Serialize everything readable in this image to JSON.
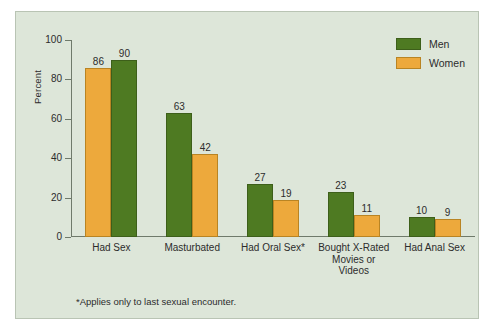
{
  "chart_data": {
    "type": "bar",
    "title": "",
    "xlabel": "",
    "ylabel": "Percent",
    "ylim": [
      0,
      100
    ],
    "yticks": [
      0,
      20,
      40,
      60,
      80,
      100
    ],
    "grid": false,
    "legend_position": "top-right",
    "categories": [
      "Had Sex",
      "Masturbated",
      "Had Oral Sex*",
      "Bought X-Rated Movies or Videos",
      "Had Anal Sex"
    ],
    "category_lines": [
      [
        "Had Sex"
      ],
      [
        "Masturbated"
      ],
      [
        "Had Oral Sex*"
      ],
      [
        "Bought X-Rated",
        "Movies or",
        "Videos"
      ],
      [
        "Had Anal Sex"
      ]
    ],
    "series": [
      {
        "name": "Men",
        "color": "#4e7a22",
        "values": [
          90,
          63,
          27,
          23,
          10
        ]
      },
      {
        "name": "Women",
        "color": "#eda93c",
        "values": [
          86,
          42,
          19,
          11,
          9
        ]
      }
    ],
    "bar_order": [
      [
        "Women",
        "Men"
      ],
      [
        "Men",
        "Women"
      ],
      [
        "Men",
        "Women"
      ],
      [
        "Men",
        "Women"
      ],
      [
        "Men",
        "Women"
      ]
    ],
    "annotation": "*Applies only to last sexual encounter."
  },
  "legend": {
    "items": [
      {
        "label": "Men",
        "color": "#4e7a22"
      },
      {
        "label": "Women",
        "color": "#eda93c"
      }
    ]
  },
  "axis": {
    "y_title": "Percent",
    "y_ticks": [
      "100",
      "80",
      "60",
      "40",
      "20",
      "0"
    ]
  },
  "footnote": "*Applies only to last sexual encounter.",
  "colors": {
    "panel_background": "#dde6d9",
    "page_background": "#ffffff",
    "panel_border": "#b9c4b4",
    "men": "#4e7a22",
    "women": "#eda93c",
    "axis": "#6f7a6b",
    "text": "#2c2c2c"
  },
  "bars_flat": [
    {
      "group": "Had Sex",
      "series": "Women",
      "value": 90
    },
    {
      "group": "Had Sex",
      "series": "Men",
      "value": 86
    },
    {
      "group": "Masturbated",
      "series": "Men",
      "value": 63
    },
    {
      "group": "Masturbated",
      "series": "Women",
      "value": 42
    },
    {
      "group": "Had Oral Sex*",
      "series": "Men",
      "value": 27
    },
    {
      "group": "Had Oral Sex*",
      "series": "Women",
      "value": 19
    },
    {
      "group": "Bought X-Rated Movies or Videos",
      "series": "Men",
      "value": 23
    },
    {
      "group": "Bought X-Rated Movies or Videos",
      "series": "Women",
      "value": 11
    },
    {
      "group": "Had Anal Sex",
      "series": "Men",
      "value": 10
    },
    {
      "group": "Had Anal Sex",
      "series": "Women",
      "value": 9
    }
  ]
}
